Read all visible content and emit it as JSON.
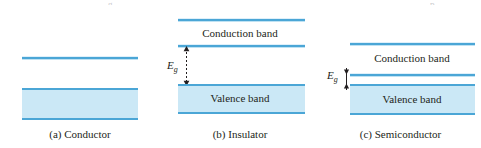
{
  "figure": {
    "bleed_fragments": [
      {
        "text": "g",
        "x": 108,
        "y": 0
      },
      {
        "text": "p",
        "x": 430,
        "y": 0
      }
    ],
    "panels": [
      {
        "id": "conductor",
        "caption": "(a) Conductor",
        "band_labels": [],
        "gap_label": null,
        "gap_subscript": null
      },
      {
        "id": "insulator",
        "caption": "(b) Insulator",
        "band_labels": [
          {
            "name": "conduction-band-label",
            "text": "Conduction band"
          },
          {
            "name": "valence-band-label",
            "text": "Valence band"
          }
        ],
        "gap_label": "E",
        "gap_subscript": "g"
      },
      {
        "id": "semiconductor",
        "caption": "(c) Semiconductor",
        "band_labels": [
          {
            "name": "conduction-band-label",
            "text": "Conduction band"
          },
          {
            "name": "valence-band-label",
            "text": "Valence band"
          }
        ],
        "gap_label": "E",
        "gap_subscript": "g"
      }
    ],
    "colors": {
      "band_line": "#4ba6d6",
      "band_fill": "#cbe8f6",
      "text": "#231f20",
      "background": "#ffffff"
    }
  }
}
